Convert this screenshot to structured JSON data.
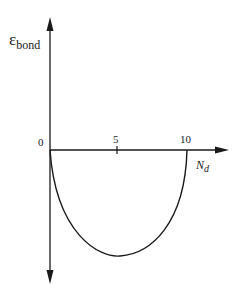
{
  "diagram": {
    "y_axis": {
      "symbol": "ε",
      "subscript": "bond"
    },
    "x_axis": {
      "symbol": "N",
      "subscript": "d"
    },
    "origin_label": "0",
    "tick_labels": [
      "5",
      "10"
    ],
    "curve": "parabola-like bowl below the x-axis from 0 to 10, minimum near 5"
  },
  "colors": {
    "line": "#1a1a1a",
    "background": "#ffffff"
  }
}
